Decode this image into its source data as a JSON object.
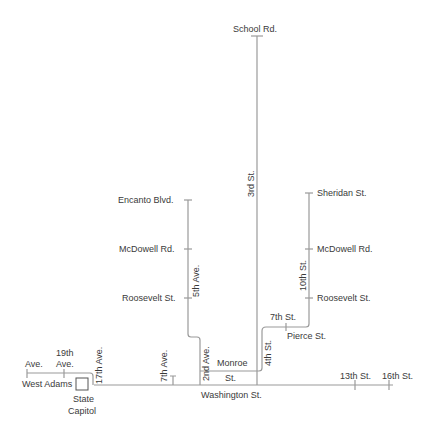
{
  "map": {
    "line_color": "#9a9a9a",
    "text_color": "#3a3a3a",
    "landmark": {
      "label_line1": "State",
      "label_line2": "Capitol"
    },
    "streets_horizontal": {
      "school_rd": "School Rd.",
      "encanto_blvd": "Encanto Blvd.",
      "sheridan_st": "Sheridan St.",
      "mcdowell_rd_west": "McDowell Rd.",
      "mcdowell_rd_east": "McDowell Rd.",
      "roosevelt_st_west": "Roosevelt St.",
      "roosevelt_st_east": "Roosevelt St.",
      "pierce_st": "Pierce St.",
      "monroe_st_line1": "Monroe",
      "monroe_st_line2": "St.",
      "washington_st": "Washington St.",
      "west_adams": "West Adams"
    },
    "streets_vertical": {
      "third_st": "3rd St.",
      "fifth_ave": "5th Ave.",
      "tenth_st": "10th St.",
      "fourth_st": "4th St.",
      "second_ave": "2nd Ave.",
      "seventh_ave": "7th Ave.",
      "seventeenth_ave": "17th Ave."
    },
    "cross_labels": {
      "seventh_st": "7th St.",
      "nineteenth_ave_line1": "19th",
      "nineteenth_ave_line2": "Ave.",
      "ave_partial": "Ave.",
      "thirteenth_st": "13th St.",
      "sixteenth_st": "16th St."
    }
  }
}
